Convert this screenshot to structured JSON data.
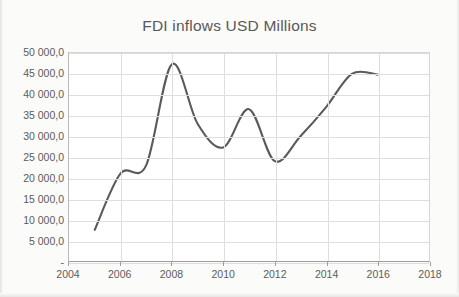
{
  "chart_data": {
    "type": "line",
    "title": "FDI inflows USD Millions",
    "xlabel": "",
    "ylabel": "",
    "x": [
      2005,
      2006,
      2007,
      2008,
      2009,
      2010,
      2011,
      2012,
      2013,
      2014,
      2015,
      2016
    ],
    "values": [
      7500,
      21000,
      23000,
      47300,
      33000,
      27300,
      36500,
      24000,
      30000,
      37000,
      45000,
      44800
    ],
    "series": [
      {
        "name": "FDI inflows USD Millions",
        "values": [
          7500,
          21000,
          23000,
          47300,
          33000,
          27300,
          36500,
          24000,
          30000,
          37000,
          45000,
          44800
        ]
      }
    ],
    "xlim": [
      2004,
      2018
    ],
    "ylim": [
      0,
      50000
    ],
    "x_tick_labels": [
      "2004",
      "2006",
      "2008",
      "2010",
      "2012",
      "2014",
      "2016",
      "2018"
    ],
    "x_tick_values": [
      2004,
      2006,
      2008,
      2010,
      2012,
      2014,
      2016,
      2018
    ],
    "y_tick_labels": [
      "50 000,0",
      "45 000,0",
      "40 000,0",
      "35 000,0",
      "30 000,0",
      "25 000,0",
      "20 000,0",
      "15 000,0",
      "10 000,0",
      "5 000,0",
      "-"
    ],
    "y_tick_values": [
      50000,
      45000,
      40000,
      35000,
      30000,
      25000,
      20000,
      15000,
      10000,
      5000,
      0
    ],
    "grid": true,
    "legend": false,
    "smooth": true,
    "line_color": "#5a5a5a",
    "grid_color": "#dedede",
    "axis_color": "#9e9e9e",
    "text_color": "#5b5b5b",
    "plot_background": "#ffffff"
  }
}
